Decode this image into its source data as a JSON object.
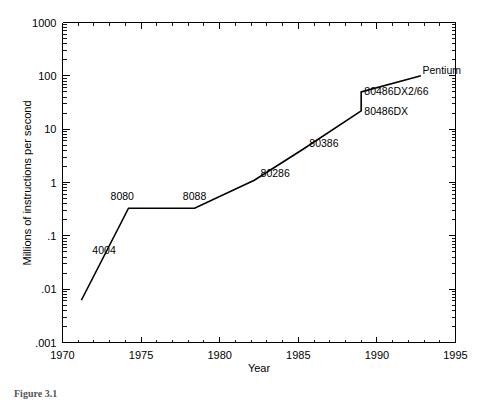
{
  "figure": {
    "caption": "Figure 3.1"
  },
  "chart_data": {
    "type": "line",
    "title": "",
    "xlabel": "Year",
    "ylabel": "Millions of instructions per second",
    "xlim": [
      1970,
      1995
    ],
    "ylim": [
      0.001,
      1000
    ],
    "yscale": "log",
    "grid": false,
    "legend": null,
    "xticks": [
      "1970",
      "1975",
      "1980",
      "1985",
      "1990",
      "1995"
    ],
    "xtick_values": [
      1970,
      1975,
      1980,
      1985,
      1990,
      1995
    ],
    "yticks": [
      "1000",
      "100",
      "10",
      "1",
      ".1",
      ".01",
      ".001"
    ],
    "ytick_values": [
      1000,
      100,
      10,
      1,
      0.1,
      0.01,
      0.001
    ],
    "series": [
      {
        "name": "Intel processor performance",
        "x": [
          1971.2,
          1974.2,
          1978.4,
          1982.2,
          1985.3,
          1989.0,
          1989.0,
          1992.8
        ],
        "y": [
          0.0062,
          0.33,
          0.33,
          1.1,
          4.2,
          22.0,
          50.0,
          100.0
        ]
      }
    ],
    "annotations": [
      {
        "label": "4004",
        "x": 1971.9,
        "y": 0.055,
        "anchor": "start"
      },
      {
        "label": "8080",
        "x": 1973.8,
        "y": 0.56,
        "anchor": "middle"
      },
      {
        "label": "8088",
        "x": 1978.4,
        "y": 0.56,
        "anchor": "middle"
      },
      {
        "label": "80286",
        "x": 1982.6,
        "y": 1.5,
        "anchor": "start"
      },
      {
        "label": "80386",
        "x": 1985.7,
        "y": 5.6,
        "anchor": "start"
      },
      {
        "label": "80486DX",
        "x": 1989.2,
        "y": 22.0,
        "anchor": "start"
      },
      {
        "label": "80486DX2/66",
        "x": 1989.2,
        "y": 52.0,
        "anchor": "start"
      },
      {
        "label": "Pentium",
        "x": 1992.9,
        "y": 130.0,
        "anchor": "start"
      }
    ]
  }
}
